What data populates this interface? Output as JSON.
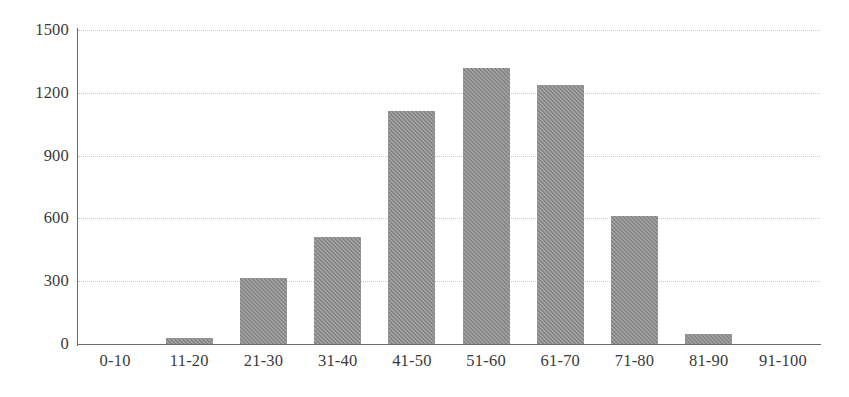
{
  "chart_data": {
    "type": "bar",
    "title": "",
    "subtitle": "",
    "xlabel": "",
    "ylabel": "",
    "categories": [
      "0-10",
      "11-20",
      "21-30",
      "31-40",
      "41-50",
      "51-60",
      "61-70",
      "71-80",
      "81-90",
      "91-100"
    ],
    "values": [
      0,
      30,
      315,
      510,
      1115,
      1320,
      1235,
      610,
      50,
      0
    ],
    "ylim": [
      0,
      1500
    ],
    "yticks": [
      0,
      300,
      600,
      900,
      1200,
      1500
    ],
    "ytick_labels": [
      "0",
      "300",
      "600",
      "900",
      "1200",
      "1500"
    ],
    "grid": true,
    "grid_axis": "y",
    "grid_style": "dotted",
    "legend": false,
    "legend_position": "none",
    "bar_color": "#8c8c8c",
    "axis_color": "#6b6b6b",
    "grid_color": "#c9c9c9",
    "background_color": "#ffffff",
    "text_color": "#3a3a3a"
  }
}
